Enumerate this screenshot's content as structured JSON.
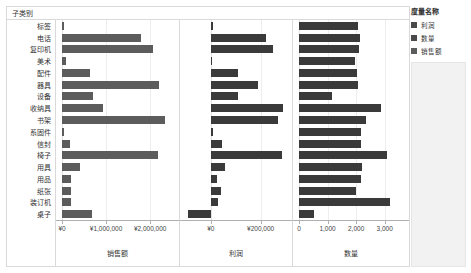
{
  "header": {
    "row_field_label": "子类别"
  },
  "legend": {
    "title": "度量名称",
    "items": [
      {
        "label": "利润",
        "color": "#4a4a4a"
      },
      {
        "label": "数量",
        "color": "#4a4a4a"
      },
      {
        "label": "销售额",
        "color": "#5c5c5c"
      }
    ]
  },
  "axes": {
    "sales": {
      "title": "销售额",
      "ticks": [
        "¥0",
        "¥1,000,000",
        "¥2,000,000"
      ]
    },
    "profit": {
      "title": "利润",
      "ticks": [
        "¥0",
        "¥200,000"
      ]
    },
    "qty": {
      "title": "数量",
      "ticks": [
        "0",
        "1,000",
        "2,000",
        "3,000"
      ]
    }
  },
  "chart_data": {
    "type": "bar",
    "title": "",
    "orientation": "horizontal",
    "panels": [
      "销售额",
      "利润",
      "数量"
    ],
    "categories": [
      "标签",
      "电话",
      "复印机",
      "美术",
      "配件",
      "器具",
      "设备",
      "收纳具",
      "书架",
      "系固件",
      "信封",
      "椅子",
      "用具",
      "用品",
      "纸张",
      "装订机",
      "桌子"
    ],
    "series": [
      {
        "name": "销售额",
        "xlabel": "销售额",
        "xlim": [
          0,
          2450000
        ],
        "ticks": [
          0,
          1000000,
          2000000
        ],
        "values": [
          45000,
          1790000,
          2060000,
          80000,
          640000,
          2210000,
          700000,
          920000,
          2340000,
          55000,
          180000,
          2180000,
          400000,
          200000,
          200000,
          210000,
          690000
        ]
      },
      {
        "name": "利润",
        "xlabel": "利润",
        "xlim": [
          -100000,
          290000
        ],
        "ticks": [
          0,
          200000
        ],
        "values": [
          7000,
          220000,
          250000,
          5000,
          110000,
          190000,
          110000,
          290000,
          270000,
          7000,
          45000,
          285000,
          55000,
          25000,
          40000,
          30000,
          -90000
        ]
      },
      {
        "name": "数量",
        "xlabel": "数量",
        "xlim": [
          0,
          3500
        ],
        "ticks": [
          0,
          1000,
          2000,
          3000
        ],
        "values": [
          2080,
          2130,
          2100,
          1960,
          2030,
          2060,
          1160,
          2880,
          2340,
          2180,
          2180,
          3070,
          2200,
          2170,
          1990,
          3170,
          540
        ]
      }
    ],
    "grid": true,
    "legend_position": "right"
  }
}
